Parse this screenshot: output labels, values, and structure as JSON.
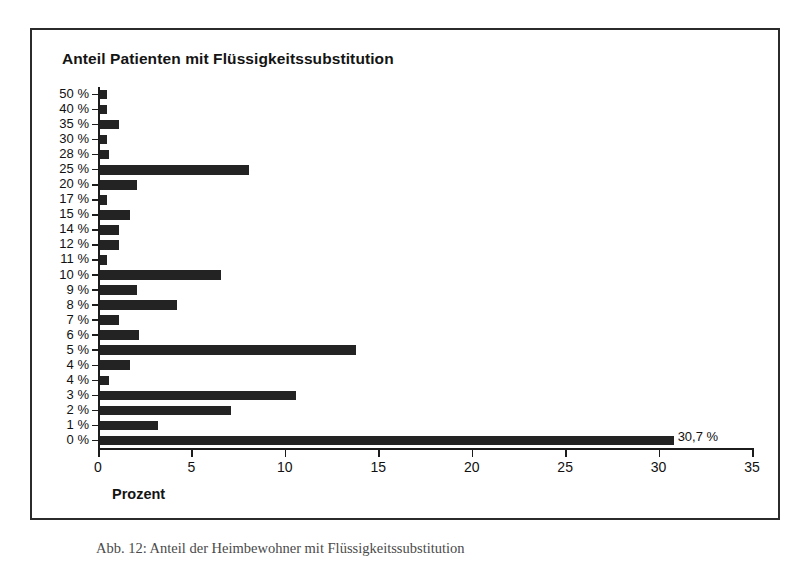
{
  "figure": {
    "caption": "Abb. 12: Anteil der Heimbewohner mit Flüssigkeitssubstitution"
  },
  "chart_data": {
    "type": "bar",
    "orientation": "horizontal",
    "title": "Anteil Patienten mit Flüssigkeitssubstitution",
    "xlabel": "Prozent",
    "ylabel": "",
    "xlim": [
      0,
      35
    ],
    "xticks": [
      0,
      5,
      10,
      15,
      20,
      25,
      30,
      35
    ],
    "xtick_labels": [
      "0",
      "5",
      "10",
      "15",
      "20",
      "25",
      "30",
      "35"
    ],
    "grid": false,
    "legend": null,
    "bar_color": "#232323",
    "categories": [
      "50 %",
      "40 %",
      "35 %",
      "30 %",
      "28 %",
      "25 %",
      "20 %",
      "17 %",
      "15 %",
      "14 %",
      "12 %",
      "11 %",
      "10 %",
      "9 %",
      "8 %",
      "7 %",
      "6 %",
      "5 %",
      "4 %",
      "4 %",
      "3 %",
      "2 %",
      "1 %",
      "0 %"
    ],
    "values": [
      0.4,
      0.4,
      1.0,
      0.4,
      0.5,
      8.0,
      2.0,
      0.4,
      1.6,
      1.0,
      1.0,
      0.4,
      6.5,
      2.0,
      4.1,
      1.0,
      2.1,
      13.7,
      1.6,
      0.5,
      10.5,
      7.0,
      3.1,
      30.7
    ],
    "data_labels": [
      "",
      "",
      "",
      "",
      "",
      "",
      "",
      "",
      "",
      "",
      "",
      "",
      "",
      "",
      "",
      "",
      "",
      "",
      "",
      "",
      "",
      "",
      "",
      "30,7 %"
    ]
  }
}
